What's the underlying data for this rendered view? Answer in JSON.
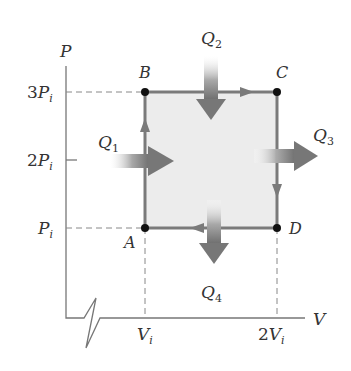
{
  "diagram": {
    "type": "PV cycle diagram",
    "axes": {
      "y_label": "P",
      "x_label": "V",
      "y_ticks": [
        {
          "coef": "3",
          "sym": "P",
          "sub": "i"
        },
        {
          "coef": "2",
          "sym": "P",
          "sub": "i"
        },
        {
          "coef": "",
          "sym": "P",
          "sub": "i"
        }
      ],
      "x_ticks": [
        {
          "coef": "",
          "sym": "V",
          "sub": "i"
        },
        {
          "coef": "2",
          "sym": "V",
          "sub": "i"
        }
      ]
    },
    "points": {
      "A": "A",
      "B": "B",
      "C": "C",
      "D": "D"
    },
    "heat_flows": [
      {
        "sym": "Q",
        "sub": "1",
        "direction": "in-right"
      },
      {
        "sym": "Q",
        "sub": "2",
        "direction": "in-down"
      },
      {
        "sym": "Q",
        "sub": "3",
        "direction": "out-right"
      },
      {
        "sym": "Q",
        "sub": "4",
        "direction": "out-down"
      }
    ],
    "cycle_order": [
      "A",
      "B",
      "C",
      "D",
      "A"
    ],
    "colors": {
      "path": "#7a7a7a",
      "fill": "#ececec",
      "point": "#111111",
      "axis": "#777777"
    }
  }
}
